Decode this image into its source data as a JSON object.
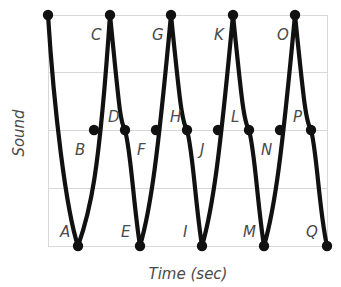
{
  "chart_data": {
    "type": "line",
    "title": "",
    "xlabel": "Time (sec)",
    "ylabel": "Sound",
    "grid": true,
    "legend": "none",
    "xlim": [
      0,
      9
    ],
    "ylim": [
      -1,
      1
    ],
    "yticks": [
      "",
      "",
      "",
      "",
      ""
    ],
    "xticks": [],
    "series": [
      {
        "name": "Sound wave",
        "color": "#111111",
        "x": [
          0.0,
          0.5,
          1.0,
          1.5,
          2.0,
          2.5,
          3.0,
          3.5,
          4.0,
          4.5,
          5.0,
          5.5,
          6.0,
          6.5,
          7.0,
          7.5,
          8.0,
          8.5,
          9.0
        ],
        "y": [
          1.0,
          -1.0,
          0.0,
          1.0,
          0.0,
          -1.0,
          0.0,
          1.0,
          0.0,
          -1.0,
          0.0,
          1.0,
          0.0,
          -1.0,
          0.0,
          1.0,
          0.0,
          -1.0,
          -1.0
        ]
      }
    ],
    "points": [
      {
        "label": "A",
        "kind": "trough",
        "x": 78,
        "y": 246,
        "label_x": 60,
        "label_y": 237
      },
      {
        "label": "B",
        "kind": "crossing",
        "x": 94,
        "y": 130,
        "label_x": 75,
        "label_y": 155
      },
      {
        "label": "C",
        "kind": "crest",
        "x": 110,
        "y": 15,
        "label_x": 91,
        "label_y": 40
      },
      {
        "label": "D",
        "kind": "crossing",
        "x": 125,
        "y": 130,
        "label_x": 108,
        "label_y": 122
      },
      {
        "label": "E",
        "kind": "trough",
        "x": 140,
        "y": 246,
        "label_x": 121,
        "label_y": 237
      },
      {
        "label": "F",
        "kind": "crossing",
        "x": 156,
        "y": 130,
        "label_x": 137,
        "label_y": 155
      },
      {
        "label": "G",
        "kind": "crest",
        "x": 171,
        "y": 15,
        "label_x": 152,
        "label_y": 40
      },
      {
        "label": "H",
        "kind": "crossing",
        "x": 187,
        "y": 130,
        "label_x": 170,
        "label_y": 122
      },
      {
        "label": "I",
        "kind": "trough",
        "x": 202,
        "y": 246,
        "label_x": 183,
        "label_y": 237
      },
      {
        "label": "J",
        "kind": "crossing",
        "x": 218,
        "y": 130,
        "label_x": 200,
        "label_y": 155
      },
      {
        "label": "K",
        "kind": "crest",
        "x": 233,
        "y": 15,
        "label_x": 214,
        "label_y": 40
      },
      {
        "label": "L",
        "kind": "crossing",
        "x": 249,
        "y": 130,
        "label_x": 231,
        "label_y": 122
      },
      {
        "label": "M",
        "kind": "trough",
        "x": 264,
        "y": 246,
        "label_x": 243,
        "label_y": 237
      },
      {
        "label": "N",
        "kind": "crossing",
        "x": 280,
        "y": 130,
        "label_x": 261,
        "label_y": 155
      },
      {
        "label": "O",
        "kind": "crest",
        "x": 295,
        "y": 15,
        "label_x": 277,
        "label_y": 40
      },
      {
        "label": "P",
        "kind": "crossing",
        "x": 311,
        "y": 130,
        "label_x": 293,
        "label_y": 122
      },
      {
        "label": "Q",
        "kind": "trough",
        "x": 327,
        "y": 246,
        "label_x": 306,
        "label_y": 237
      },
      {
        "label": "",
        "kind": "crest",
        "x": 48,
        "y": 15,
        "label_x": 0,
        "label_y": 0
      }
    ],
    "wave_path": "M 48,15 C 54,110 66,210 78,246 C 90,212 99,178 110,15 C 119,104 120,122 125,130 C 131,152 133,200 140,246 C 151,208 158,154 171,15 C 180,104 182,122 187,130 C 193,152 195,200 202,246 C 213,208 220,154 233,15 C 242,104 244,122 249,130 C 255,152 257,200 264,246 C 275,208 282,154 295,15 C 304,104 306,122 311,130 C 317,152 319,210 327,246",
    "gridlines_y": [
      15,
      72,
      130,
      188,
      246
    ],
    "plot_box": {
      "left": 48,
      "top": 15,
      "right": 327,
      "bottom": 246
    },
    "marker_radius": 5.2,
    "grid_color": "#d8d8d8",
    "line_color": "#111111",
    "label_color": "#4a4a4a",
    "background": "#ffffff"
  }
}
